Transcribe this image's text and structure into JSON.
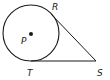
{
  "diagram": {
    "type": "geometry",
    "colors": {
      "stroke": "#1a1a1a",
      "background": "#ffffff"
    },
    "circle": {
      "center_label": "P",
      "cx": 31,
      "cy": 33,
      "r": 28
    },
    "points": {
      "P": {
        "label": "P",
        "x": 31,
        "y": 34
      },
      "R": {
        "label": "R",
        "x": 51,
        "y": 14
      },
      "S": {
        "label": "S",
        "x": 96,
        "y": 61
      },
      "T": {
        "label": "T",
        "x": 33,
        "y": 61
      }
    },
    "segments": [
      {
        "from": "R",
        "to": "S"
      },
      {
        "from": "T",
        "to": "S"
      }
    ]
  }
}
